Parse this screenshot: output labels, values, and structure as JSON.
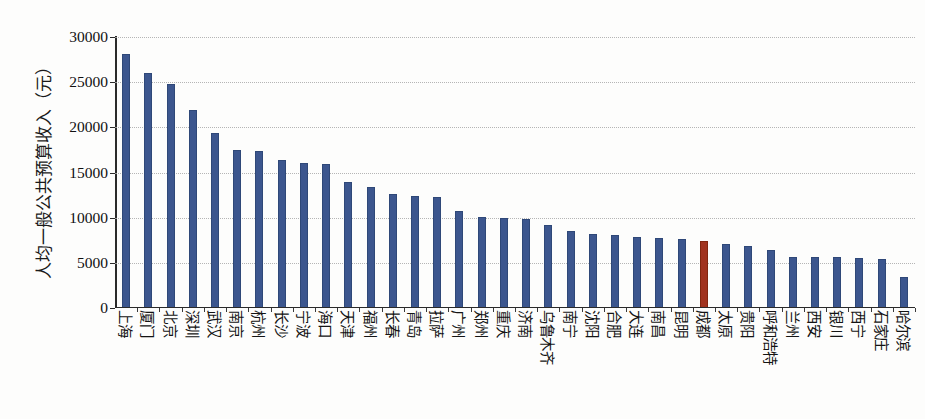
{
  "chart_data": {
    "type": "bar",
    "title": "",
    "xlabel": "",
    "ylabel": "人均一般公共预算收入（元）",
    "ylim": [
      0,
      30000
    ],
    "ytick_labels": [
      "0",
      "5000",
      "10000",
      "15000",
      "20000",
      "25000",
      "30000"
    ],
    "ytick_values": [
      0,
      5000,
      10000,
      15000,
      20000,
      25000,
      30000
    ],
    "grid": true,
    "legend": "none",
    "highlight_category": "成都",
    "colors": {
      "bar": "#3c568e",
      "highlight": "#a1331f",
      "grid": "#a9a9a9",
      "axis": "#2a2a2a",
      "text": "#141414",
      "background": "#fdfdfc"
    },
    "categories": [
      "上海",
      "厦门",
      "北京",
      "深圳",
      "武汉",
      "南京",
      "杭州",
      "长沙",
      "宁波",
      "海口",
      "天津",
      "福州",
      "长春",
      "青岛",
      "拉萨",
      "广州",
      "郑州",
      "重庆",
      "济南",
      "乌鲁木齐",
      "南宁",
      "沈阳",
      "合肥",
      "大连",
      "南昌",
      "昆明",
      "成都",
      "太原",
      "贵阳",
      "呼和浩特",
      "兰州",
      "西安",
      "银川",
      "西宁",
      "石家庄",
      "哈尔滨"
    ],
    "values": [
      28100,
      26000,
      24800,
      21900,
      19400,
      17500,
      17400,
      16400,
      16100,
      15900,
      13900,
      13400,
      12600,
      12400,
      12300,
      10700,
      10100,
      10000,
      9900,
      9200,
      8500,
      8200,
      8100,
      7900,
      7700,
      7600,
      7400,
      7100,
      6900,
      6400,
      5700,
      5700,
      5600,
      5500,
      5400,
      3400
    ]
  }
}
